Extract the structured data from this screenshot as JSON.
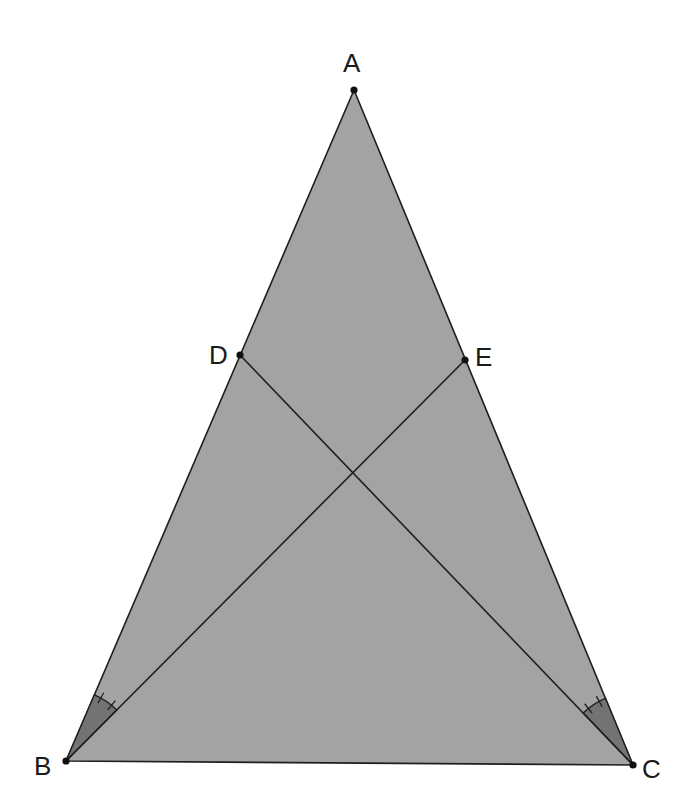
{
  "diagram": {
    "type": "geometry",
    "colors": {
      "background": "#ffffff",
      "triangle_fill": "#a3a3a3",
      "angle_fill": "#737373",
      "stroke": "#1e1e1e",
      "point": "#111111"
    },
    "points": {
      "A": {
        "label": "A",
        "x": 354,
        "y": 90
      },
      "B": {
        "label": "B",
        "x": 66,
        "y": 761
      },
      "C": {
        "label": "C",
        "x": 633,
        "y": 765
      },
      "D": {
        "label": "D",
        "x": 240,
        "y": 355
      },
      "E": {
        "label": "E",
        "x": 465,
        "y": 360
      }
    },
    "segments": [
      "AB",
      "AC",
      "BC",
      "BE",
      "CD"
    ],
    "angle_marks": [
      {
        "vertex": "B",
        "between": [
          "BA",
          "BE"
        ],
        "ticks": 2
      },
      {
        "vertex": "C",
        "between": [
          "CA",
          "CD"
        ],
        "ticks": 2
      }
    ]
  }
}
